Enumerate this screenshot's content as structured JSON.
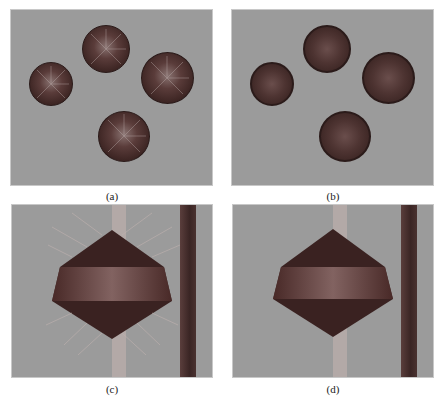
{
  "figure": {
    "panels": [
      {
        "id": "a",
        "caption": "(a)",
        "description": "four rendered spheres with radiating surface normal vectors"
      },
      {
        "id": "b",
        "caption": "(b)",
        "description": "four rendered spheres, shaded, no vectors"
      },
      {
        "id": "c",
        "caption": "(c)",
        "description": "double-cone (bicone) shape with radiating normal arrows, vertical light bar and dark vertical column"
      },
      {
        "id": "d",
        "caption": "(d)",
        "description": "double-cone shape shaded, vertical light bar and dark vertical column"
      }
    ],
    "colors": {
      "background": "#9b9b9b",
      "object_dark": "#3a2221",
      "object_band": "#7a5a58",
      "column_dark": "#4a3432",
      "light_bar": "#b0a8a6"
    }
  }
}
